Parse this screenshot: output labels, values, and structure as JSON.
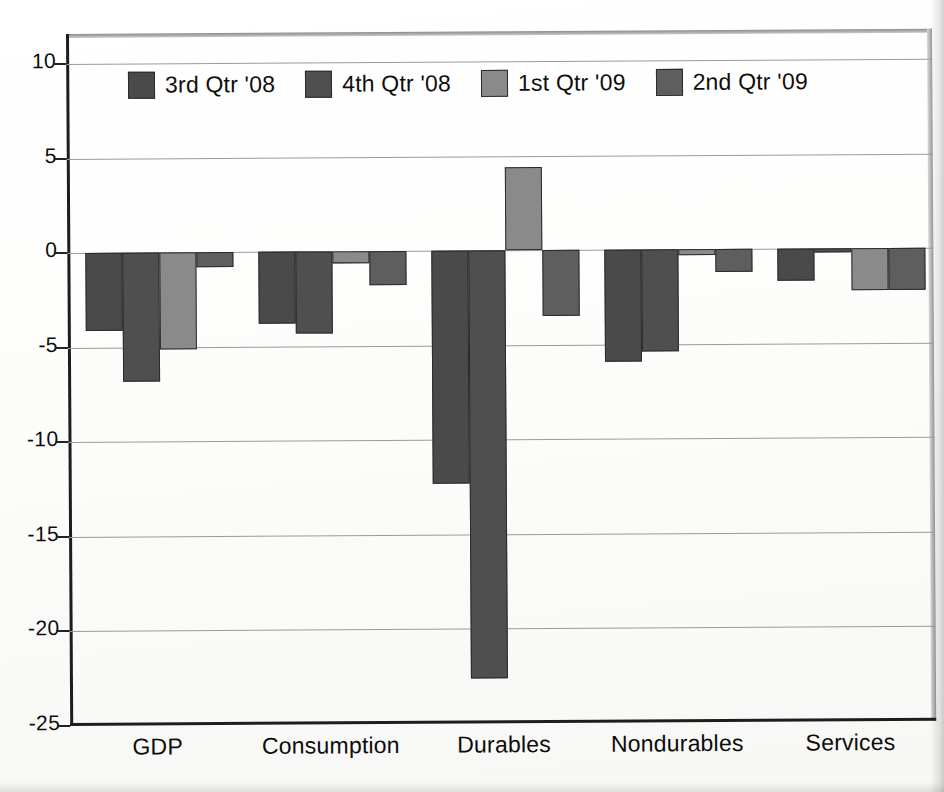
{
  "chart_data": {
    "type": "bar",
    "title": "",
    "subtitle": "",
    "xlabel": "",
    "ylabel": "",
    "categories": [
      "GDP",
      "Consumption",
      "Durables",
      "Nondurables",
      "Services"
    ],
    "series": [
      {
        "name": "3rd Qtr '08",
        "color": "#4a4a4a",
        "values": [
          -4.1,
          -3.8,
          -12.3,
          -5.9,
          -1.7
        ]
      },
      {
        "name": "4th Qtr '08",
        "color": "#4f4f4f",
        "values": [
          -6.8,
          -4.3,
          -22.6,
          -5.4,
          -0.2
        ]
      },
      {
        "name": "1st Qtr '09",
        "color": "#8a8a8a",
        "values": [
          -5.1,
          -0.6,
          4.4,
          -0.3,
          -2.2
        ]
      },
      {
        "name": "2nd Qtr '09",
        "color": "#5e5e5e",
        "values": [
          -0.8,
          -1.8,
          -3.5,
          -1.2,
          -2.2
        ]
      }
    ],
    "ylim": [
      -25,
      11.6
    ],
    "yticks": [
      10,
      5,
      0,
      -5,
      -10,
      -15,
      -20,
      -25
    ],
    "ytick_labels": [
      "10",
      "5",
      "0",
      "-5",
      "-10",
      "-15",
      "-20",
      "-25"
    ],
    "grid": true,
    "grid_axis": "y",
    "legend_position": "top-left-inside",
    "zero_line": 0
  },
  "legend": {
    "items": [
      {
        "label": "3rd Qtr '08",
        "color": "#4a4a4a"
      },
      {
        "label": "4th Qtr '08",
        "color": "#4f4f4f"
      },
      {
        "label": "1st Qtr '09",
        "color": "#8a8a8a"
      },
      {
        "label": "2nd Qtr '09",
        "color": "#5e5e5e"
      }
    ]
  }
}
